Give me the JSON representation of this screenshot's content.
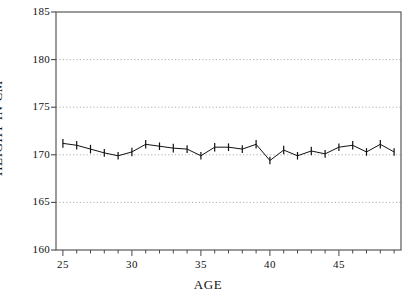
{
  "chart_data": {
    "type": "line",
    "title": "",
    "xlabel": "AGE",
    "ylabel": "HEIGHT IN CM",
    "xlim": [
      24.5,
      49.5
    ],
    "ylim": [
      160,
      185
    ],
    "ytick_labels": [
      "185",
      "180",
      "175",
      "170",
      "165",
      "160"
    ],
    "yticks": [
      185,
      180,
      175,
      170,
      165,
      160
    ],
    "xtick_labels": [
      "25",
      "30",
      "35",
      "40",
      "45"
    ],
    "xticks": [
      25,
      30,
      35,
      40,
      45
    ],
    "minor_xticks_every": 1,
    "grid": "horizontal-dotted",
    "grid_color": "#999999",
    "series_color": "#111111",
    "marker": "vertical-tick-error-bar",
    "legend": "none",
    "x": [
      25,
      26,
      27,
      28,
      29,
      30,
      31,
      32,
      33,
      34,
      35,
      36,
      37,
      38,
      39,
      40,
      41,
      42,
      43,
      44,
      45,
      46,
      47,
      48,
      49
    ],
    "values": [
      171.2,
      171.0,
      170.6,
      170.2,
      169.9,
      170.3,
      171.1,
      170.9,
      170.7,
      170.6,
      169.9,
      170.8,
      170.8,
      170.6,
      171.1,
      169.4,
      170.5,
      169.9,
      170.4,
      170.1,
      170.8,
      171.0,
      170.3,
      171.1,
      170.3
    ],
    "err": [
      0.45,
      0.45,
      0.45,
      0.4,
      0.4,
      0.45,
      0.45,
      0.4,
      0.45,
      0.4,
      0.4,
      0.45,
      0.4,
      0.4,
      0.45,
      0.4,
      0.45,
      0.4,
      0.45,
      0.4,
      0.4,
      0.45,
      0.4,
      0.45,
      0.4
    ]
  }
}
